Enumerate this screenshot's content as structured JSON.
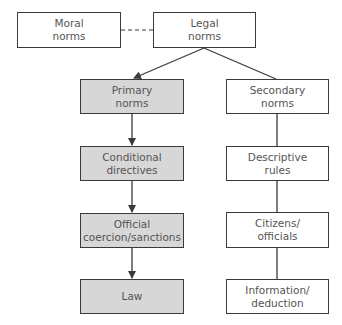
{
  "diagram": {
    "type": "hierarchy-flowchart",
    "colors": {
      "line": "#3a3a3a",
      "shaded_fill": "#d7d7d7",
      "text": "#555555",
      "background": "#ffffff"
    },
    "nodes": {
      "moral": {
        "line1": "Moral",
        "line2": "norms",
        "shaded": false
      },
      "legal": {
        "line1": "Legal",
        "line2": "norms",
        "shaded": false
      },
      "primary": {
        "line1": "Primary",
        "line2": "norms",
        "shaded": true
      },
      "secondary": {
        "line1": "Secondary",
        "line2": "norms",
        "shaded": false
      },
      "conditional": {
        "line1": "Conditional",
        "line2": "directives",
        "shaded": true
      },
      "descriptive": {
        "line1": "Descriptive",
        "line2": "rules",
        "shaded": false
      },
      "official": {
        "line1": "Official",
        "line2": "coercion/sanctions",
        "shaded": true
      },
      "citizens": {
        "line1": "Citizens/",
        "line2": "officials",
        "shaded": false
      },
      "law": {
        "line1": "Law",
        "shaded": true
      },
      "information": {
        "line1": "Information/",
        "line2": "deduction",
        "shaded": false
      }
    },
    "edges": [
      {
        "from": "moral",
        "to": "legal",
        "style": "dashed",
        "arrow": false
      },
      {
        "from": "legal",
        "to": "primary",
        "style": "solid",
        "arrow": true
      },
      {
        "from": "legal",
        "to": "secondary",
        "style": "solid",
        "arrow": false
      },
      {
        "from": "primary",
        "to": "conditional",
        "style": "solid",
        "arrow": true
      },
      {
        "from": "conditional",
        "to": "official",
        "style": "solid",
        "arrow": true
      },
      {
        "from": "official",
        "to": "law",
        "style": "solid",
        "arrow": true
      },
      {
        "from": "secondary",
        "to": "descriptive",
        "style": "solid",
        "arrow": false
      },
      {
        "from": "descriptive",
        "to": "citizens",
        "style": "solid",
        "arrow": false
      },
      {
        "from": "citizens",
        "to": "information",
        "style": "solid",
        "arrow": false
      }
    ]
  }
}
